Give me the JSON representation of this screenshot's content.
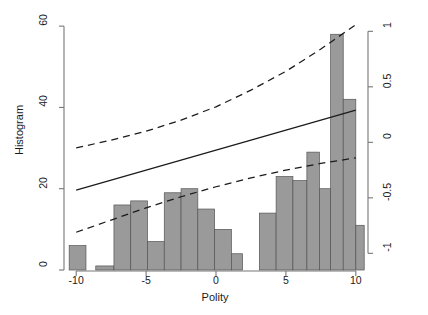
{
  "chart_data": {
    "type": "bar",
    "title": "",
    "subtitle": "",
    "xlabel": "Polity",
    "ylabel": "Histogram",
    "ylabel_right": "Marginal Effect of Trade Tax Revenue",
    "xlim": [
      -10.8,
      10.8
    ],
    "ylim": [
      0,
      62
    ],
    "ylim_right": [
      -1.15,
      1.12
    ],
    "grid": false,
    "legend": null,
    "xticks": [
      -10,
      -5,
      0,
      5,
      10
    ],
    "xticklabels": [
      "-10",
      "-5",
      "0",
      "5",
      "10"
    ],
    "yticks": [
      0,
      20,
      40,
      60
    ],
    "yticklabels": [
      "0",
      "20",
      "40",
      "60"
    ],
    "yticks_right": [
      -1,
      -0.5,
      0,
      0.5,
      1
    ],
    "yticklabels_right": [
      "-1",
      "-0.5",
      "0",
      "0.5",
      "1"
    ],
    "bar_color": "#9a9a9a",
    "bar_edge_color": "#555555",
    "line_color": "#1b1b1b",
    "axis_color": "#777777",
    "histogram": {
      "note": "bars on left Histogram axis; x = Polity bin, height = count",
      "bins": [
        {
          "x0": -10.5,
          "x1": -9.3,
          "count": 6
        },
        {
          "x0": -8.6,
          "x1": -7.3,
          "count": 1
        },
        {
          "x0": -7.3,
          "x1": -6.1,
          "count": 16
        },
        {
          "x0": -6.1,
          "x1": -4.9,
          "count": 17
        },
        {
          "x0": -4.9,
          "x1": -3.7,
          "count": 7
        },
        {
          "x0": -3.7,
          "x1": -2.5,
          "count": 19
        },
        {
          "x0": -2.5,
          "x1": -1.3,
          "count": 20
        },
        {
          "x0": -1.3,
          "x1": -0.1,
          "count": 15
        },
        {
          "x0": -0.1,
          "x1": 1.1,
          "count": 10
        },
        {
          "x0": 1.1,
          "x1": 1.9,
          "count": 4
        },
        {
          "x0": 3.1,
          "x1": 4.3,
          "count": 14
        },
        {
          "x0": 4.3,
          "x1": 5.5,
          "count": 23
        },
        {
          "x0": 5.5,
          "x1": 6.5,
          "count": 22
        },
        {
          "x0": 6.5,
          "x1": 7.4,
          "count": 29
        },
        {
          "x0": 7.4,
          "x1": 8.2,
          "count": 20
        },
        {
          "x0": 8.2,
          "x1": 9.1,
          "count": 58
        },
        {
          "x0": 9.1,
          "x1": 10.0,
          "count": 42
        },
        {
          "x0": 10.0,
          "x1": 10.6,
          "count": 11
        }
      ]
    },
    "series": [
      {
        "name": "marginal effect",
        "style": "solid",
        "axis": "right",
        "x": [
          -10,
          -7.5,
          -5,
          -2.5,
          0,
          2.5,
          5,
          7.5,
          10
        ],
        "y": [
          -0.43,
          -0.34,
          -0.25,
          -0.16,
          -0.07,
          0.02,
          0.11,
          0.2,
          0.29
        ]
      },
      {
        "name": "upper 95% confidence bound",
        "style": "dashed",
        "axis": "right",
        "x": [
          -10,
          -7.5,
          -5,
          -2.5,
          0,
          2.5,
          5,
          7.5,
          10
        ],
        "y": [
          -0.05,
          0.02,
          0.1,
          0.2,
          0.32,
          0.47,
          0.64,
          0.84,
          1.06
        ]
      },
      {
        "name": "lower 95% confidence bound",
        "style": "dashed",
        "axis": "right",
        "x": [
          -10,
          -7.5,
          -5,
          -2.5,
          0,
          2.5,
          5,
          7.5,
          10
        ],
        "y": [
          -0.81,
          -0.7,
          -0.59,
          -0.49,
          -0.4,
          -0.32,
          -0.25,
          -0.19,
          -0.14
        ]
      }
    ]
  }
}
